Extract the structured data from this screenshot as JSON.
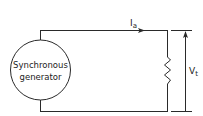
{
  "diagram": {
    "generator": {
      "line1": "Synchronous",
      "line2": "generator"
    },
    "current_label": {
      "main": "I",
      "sub": "a"
    },
    "voltage_label": {
      "main": "V",
      "sub": "t"
    },
    "colors": {
      "line": "#2a2a2a",
      "background": "#ffffff"
    }
  }
}
